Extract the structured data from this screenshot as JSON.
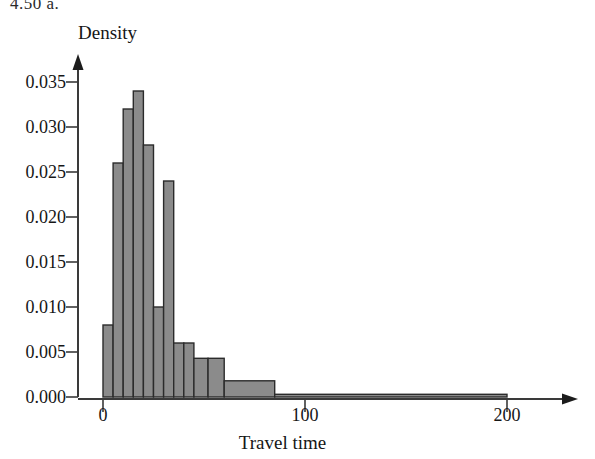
{
  "page": {
    "corner_note": "4.50 a."
  },
  "chart_data": {
    "type": "bar",
    "title": "",
    "subtitle": "",
    "xlabel": "Travel time",
    "ylabel": "Density",
    "xlim": [
      0,
      207
    ],
    "ylim": [
      0.0,
      0.0365
    ],
    "grid": false,
    "legend": null,
    "xticks": [
      0,
      100,
      200
    ],
    "xtick_labels": [
      "0",
      "100",
      "200"
    ],
    "yticks": [
      0.0,
      0.005,
      0.01,
      0.015,
      0.02,
      0.025,
      0.03,
      0.035
    ],
    "ytick_labels": [
      "0.000",
      "0.005",
      "0.010",
      "0.015",
      "0.020",
      "0.025",
      "0.030",
      "0.035"
    ],
    "bin_edges": [
      0,
      5,
      10,
      15,
      20,
      25,
      30,
      35,
      40,
      45,
      50,
      60,
      85,
      200
    ],
    "values": [
      0.008,
      0.026,
      0.032,
      0.034,
      0.028,
      0.01,
      0.024,
      0.006,
      0.006,
      0.0043,
      0.0043,
      0.0018,
      0.0003
    ],
    "bars": [
      {
        "x0": 0,
        "x1": 5,
        "height": 0.008
      },
      {
        "x0": 5,
        "x1": 10,
        "height": 0.026
      },
      {
        "x0": 10,
        "x1": 15,
        "height": 0.032
      },
      {
        "x0": 15,
        "x1": 20,
        "height": 0.034
      },
      {
        "x0": 20,
        "x1": 25,
        "height": 0.028
      },
      {
        "x0": 25,
        "x1": 30,
        "height": 0.01
      },
      {
        "x0": 30,
        "x1": 35,
        "height": 0.024
      },
      {
        "x0": 35,
        "x1": 40,
        "height": 0.006
      },
      {
        "x0": 40,
        "x1": 45,
        "height": 0.006
      },
      {
        "x0": 45,
        "x1": 52,
        "height": 0.0043
      },
      {
        "x0": 52,
        "x1": 60,
        "height": 0.0043
      },
      {
        "x0": 60,
        "x1": 85,
        "height": 0.0018
      },
      {
        "x0": 85,
        "x1": 200,
        "height": 0.0003
      }
    ],
    "colors": {
      "bar_fill": "#8b8b8b",
      "bar_stroke": "#2b2b2b",
      "axis": "#3a3a3a",
      "text": "#161616",
      "background": "#ffffff"
    }
  }
}
